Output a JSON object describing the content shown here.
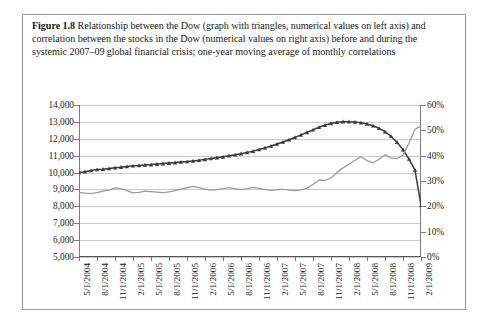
{
  "figure": {
    "number": "Figure 1.8",
    "caption": "Relationship between the Dow (graph with triangles, numerical values on left axis) and correlation between the stocks in the Dow (numerical values on right axis) before and during the systemic 2007–09 global financial crisis; one-year moving average of monthly correlations"
  },
  "colors": {
    "dow_line": "#3a3a3a",
    "correlation_line": "#9b9b9b",
    "gridline": "#c9c9c9",
    "axis": "#7d7d7d",
    "border": "#9a9a9a",
    "background": "#ffffff"
  },
  "chart_data": {
    "type": "line",
    "title": "",
    "xlabel": "",
    "ylabel": "",
    "grid": true,
    "legend": "none",
    "y_left": {
      "label": "Dow Jones Industrial Average",
      "ticks": [
        "5,000",
        "6,000",
        "7,000",
        "8,000",
        "9,000",
        "10,000",
        "11,000",
        "12,000",
        "13,000",
        "14,000"
      ],
      "values": [
        5000,
        6000,
        7000,
        8000,
        9000,
        10000,
        11000,
        12000,
        13000,
        14000
      ],
      "ylim": [
        5000,
        14000
      ]
    },
    "y_right": {
      "label": "Correlation between stocks in the Dow",
      "ticks": [
        "0%",
        "10%",
        "20%",
        "30%",
        "40%",
        "50%",
        "60%"
      ],
      "values": [
        0,
        10,
        20,
        30,
        40,
        50,
        60
      ],
      "ylim": [
        0,
        60
      ]
    },
    "x_tick_labels": [
      "5/1/2004",
      "8/1/2004",
      "11/1/2004",
      "2/1/2005",
      "5/1/2005",
      "8/1/2005",
      "11/1/2005",
      "2/1/2006",
      "5/1/2006",
      "8/1/2006",
      "11/1/2006",
      "2/1/2007",
      "5/1/2007",
      "8/1/2007",
      "11/1/2007",
      "2/1/2008",
      "5/1/2008",
      "8/1/2008",
      "11/1/2008",
      "2/1/2009"
    ],
    "series": [
      {
        "name": "Dow",
        "axis": "left",
        "marker": "triangle",
        "color": "#3a3a3a",
        "x": [
          "5/1/2004",
          "6/1/2004",
          "7/1/2004",
          "8/1/2004",
          "9/1/2004",
          "10/1/2004",
          "11/1/2004",
          "12/1/2004",
          "1/1/2005",
          "2/1/2005",
          "3/1/2005",
          "4/1/2005",
          "5/1/2005",
          "6/1/2005",
          "7/1/2005",
          "8/1/2005",
          "9/1/2005",
          "10/1/2005",
          "11/1/2005",
          "12/1/2005",
          "1/1/2006",
          "2/1/2006",
          "3/1/2006",
          "4/1/2006",
          "5/1/2006",
          "6/1/2006",
          "7/1/2006",
          "8/1/2006",
          "9/1/2006",
          "10/1/2006",
          "11/1/2006",
          "12/1/2006",
          "1/1/2007",
          "2/1/2007",
          "3/1/2007",
          "4/1/2007",
          "5/1/2007",
          "6/1/2007",
          "7/1/2007",
          "8/1/2007",
          "9/1/2007",
          "10/1/2007",
          "11/1/2007",
          "12/1/2007",
          "1/1/2008",
          "2/1/2008",
          "3/1/2008",
          "4/1/2008",
          "5/1/2008",
          "6/1/2008",
          "7/1/2008",
          "8/1/2008",
          "9/1/2008",
          "10/1/2008",
          "11/1/2008",
          "12/1/2008",
          "1/1/2009",
          "2/1/2009"
        ],
        "values": [
          10000,
          10050,
          10120,
          10180,
          10200,
          10240,
          10280,
          10320,
          10360,
          10400,
          10420,
          10450,
          10470,
          10500,
          10530,
          10560,
          10590,
          10620,
          10650,
          10690,
          10730,
          10780,
          10830,
          10880,
          10930,
          10990,
          11050,
          11120,
          11190,
          11270,
          11360,
          11460,
          11570,
          11690,
          11810,
          11940,
          12080,
          12230,
          12380,
          12530,
          12680,
          12810,
          12910,
          12980,
          13010,
          13010,
          12990,
          12950,
          12880,
          12770,
          12620,
          12420,
          12150,
          11800,
          11350,
          10800,
          10150,
          8050
        ]
      },
      {
        "name": "Correlation between stocks in the Dow",
        "axis": "right",
        "marker": "none",
        "color": "#9b9b9b",
        "x": [
          "5/1/2004",
          "6/1/2004",
          "7/1/2004",
          "8/1/2004",
          "9/1/2004",
          "10/1/2004",
          "11/1/2004",
          "12/1/2004",
          "1/1/2005",
          "2/1/2005",
          "3/1/2005",
          "4/1/2005",
          "5/1/2005",
          "6/1/2005",
          "7/1/2005",
          "8/1/2005",
          "9/1/2005",
          "10/1/2005",
          "11/1/2005",
          "12/1/2005",
          "1/1/2006",
          "2/1/2006",
          "3/1/2006",
          "4/1/2006",
          "5/1/2006",
          "6/1/2006",
          "7/1/2006",
          "8/1/2006",
          "9/1/2006",
          "10/1/2006",
          "11/1/2006",
          "12/1/2006",
          "1/1/2007",
          "2/1/2007",
          "3/1/2007",
          "4/1/2007",
          "5/1/2007",
          "6/1/2007",
          "7/1/2007",
          "8/1/2007",
          "9/1/2007",
          "10/1/2007",
          "11/1/2007",
          "12/1/2007",
          "1/1/2008",
          "2/1/2008",
          "3/1/2008",
          "4/1/2008",
          "5/1/2008",
          "6/1/2008",
          "7/1/2008",
          "8/1/2008",
          "9/1/2008",
          "10/1/2008",
          "11/1/2008",
          "12/1/2008",
          "1/1/2009",
          "2/1/2009"
        ],
        "values": [
          25.5,
          25.2,
          25.0,
          25.4,
          26.0,
          26.4,
          27.3,
          27.0,
          26.2,
          25.3,
          25.5,
          26.0,
          25.8,
          25.6,
          25.4,
          25.7,
          26.2,
          26.8,
          27.4,
          27.9,
          27.4,
          26.8,
          26.4,
          26.6,
          27.0,
          27.4,
          27.0,
          26.6,
          27.0,
          27.5,
          27.1,
          26.6,
          26.3,
          26.5,
          26.8,
          26.4,
          26.2,
          26.5,
          27.2,
          28.6,
          30.4,
          30.2,
          31.2,
          33.4,
          35.2,
          36.6,
          38.2,
          39.6,
          38.0,
          37.2,
          38.6,
          40.4,
          39.0,
          38.8,
          40.2,
          45.0,
          50.4,
          51.8
        ]
      }
    ],
    "annotations": []
  }
}
